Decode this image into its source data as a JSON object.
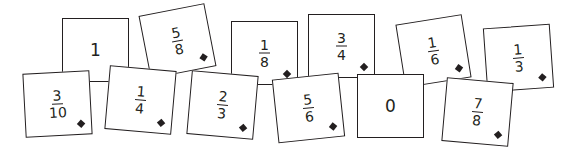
{
  "cards": [
    {
      "id": "c1",
      "label": "1",
      "num": "1",
      "den": "",
      "whole": true,
      "diamond": false,
      "x": 62,
      "y": 18,
      "rot": 0
    },
    {
      "id": "c58",
      "label": "5/8",
      "num": "5",
      "den": "8",
      "whole": false,
      "diamond": true,
      "x": 144,
      "y": 9,
      "rot": -11
    },
    {
      "id": "c18",
      "label": "1/8",
      "num": "1",
      "den": "8",
      "whole": false,
      "diamond": true,
      "x": 231,
      "y": 21,
      "rot": 0
    },
    {
      "id": "c34",
      "label": "3/4",
      "num": "3",
      "den": "4",
      "whole": false,
      "diamond": true,
      "x": 308,
      "y": 14,
      "rot": 0
    },
    {
      "id": "c16",
      "label": "1/6",
      "num": "1",
      "den": "6",
      "whole": false,
      "diamond": true,
      "x": 400,
      "y": 19,
      "rot": -9
    },
    {
      "id": "c13",
      "label": "1/3",
      "num": "1",
      "den": "3",
      "whole": false,
      "diamond": true,
      "x": 485,
      "y": 26,
      "rot": -4
    },
    {
      "id": "c310",
      "label": "3/10",
      "num": "3",
      "den": "10",
      "whole": false,
      "diamond": true,
      "x": 24,
      "y": 72,
      "rot": -3
    },
    {
      "id": "c14",
      "label": "1/4",
      "num": "1",
      "den": "4",
      "whole": false,
      "diamond": true,
      "x": 107,
      "y": 68,
      "rot": 5
    },
    {
      "id": "c23",
      "label": "2/3",
      "num": "2",
      "den": "3",
      "whole": false,
      "diamond": true,
      "x": 189,
      "y": 73,
      "rot": 5
    },
    {
      "id": "c56",
      "label": "5/6",
      "num": "5",
      "den": "6",
      "whole": false,
      "diamond": true,
      "x": 275,
      "y": 76,
      "rot": -6
    },
    {
      "id": "c0",
      "label": "0",
      "num": "0",
      "den": "",
      "whole": true,
      "diamond": false,
      "x": 357,
      "y": 74,
      "rot": 0
    },
    {
      "id": "c78",
      "label": "7/8",
      "num": "7",
      "den": "8",
      "whole": false,
      "diamond": true,
      "x": 444,
      "y": 80,
      "rot": 5
    }
  ],
  "colors": {
    "ink": "#231f20",
    "card_bg": "#ffffff",
    "page_bg": "#ffffff"
  }
}
